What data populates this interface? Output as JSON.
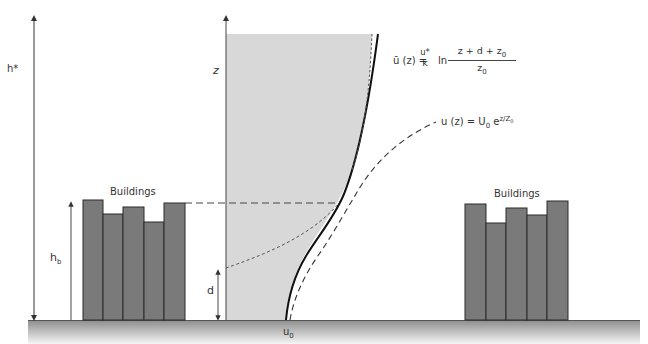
{
  "diagram": {
    "labels": {
      "h_star": "h*",
      "h_b": "h",
      "h_b_sub": "b",
      "z_axis": "z",
      "d": "d",
      "u0": "u",
      "u0_sub": "0"
    },
    "buildings_left": {
      "label": "Buildings",
      "heights": [
        121,
        107,
        114,
        99,
        118
      ]
    },
    "buildings_right": {
      "label": "Buildings",
      "heights": [
        117,
        98,
        113,
        105,
        120
      ]
    },
    "equations": {
      "log_profile": {
        "lhs": "ū (z) =",
        "coef_num": "u*",
        "coef_den": "k",
        "ln": "ln",
        "frac_num": "z + d + z",
        "frac_num_sub": "0",
        "frac_den": "z",
        "frac_den_sub": "0"
      },
      "exp_profile": {
        "lhs": "u (z) = U",
        "lhs_sub": "0",
        "e": "e",
        "exponent": "z/Z",
        "exponent_sub": "0"
      }
    },
    "colors": {
      "building_fill": "#7a7a7a",
      "building_stroke": "#2a2a2a",
      "shade_fill": "#d6d6d6",
      "ground_top": "#8c8c8c",
      "ground_bottom": "#f4f4f4",
      "line": "#222222"
    }
  }
}
